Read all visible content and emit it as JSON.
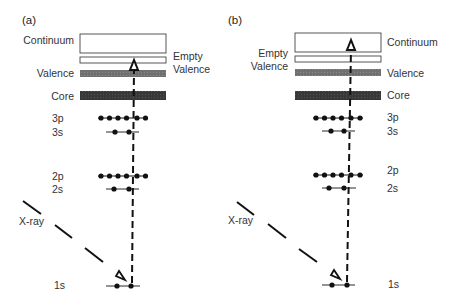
{
  "colors": {
    "background": "#ffffff",
    "ink": "#111111",
    "text": "#333333",
    "valence_fill": "#6e6e6e",
    "core_fill": "#3a3a3a",
    "box_stroke": "#444444"
  },
  "panels": [
    {
      "id": "a",
      "label": "(a)",
      "bands": {
        "continuum": "Continuum",
        "empty_valence_line1": "Empty",
        "empty_valence_line2": "Valence",
        "valence": "Valence",
        "core": "Core"
      },
      "levels": [
        "3p",
        "3s",
        "2p",
        "2s",
        "1s"
      ],
      "xray_label": "X-ray",
      "transition": "1s electron excited to empty valence state"
    },
    {
      "id": "b",
      "label": "(b)",
      "bands": {
        "continuum": "Continuum",
        "empty_valence_line1": "Empty",
        "empty_valence_line2": "Valence",
        "valence": "Valence",
        "core": "Core"
      },
      "levels": [
        "3p",
        "3s",
        "2p",
        "2s",
        "1s"
      ],
      "xray_label": "X-ray",
      "transition": "1s electron ejected into continuum"
    }
  ]
}
